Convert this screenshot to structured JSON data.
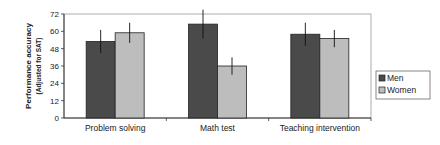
{
  "chart_data": {
    "type": "bar",
    "title": "",
    "xlabel": "",
    "ylabel": "Performance accuracy",
    "ylabel_sub": "(Adjusted for SAT)",
    "categories": [
      "Problem solving",
      "Math test",
      "Teaching intervention"
    ],
    "series": [
      {
        "name": "Men",
        "color": "#4a4a4a",
        "values": [
          53,
          65,
          58
        ],
        "errors": [
          8,
          10,
          8
        ]
      },
      {
        "name": "Women",
        "color": "#bdbdbd",
        "values": [
          59,
          36,
          55
        ],
        "errors": [
          7,
          6,
          6
        ]
      }
    ],
    "ylim": [
      0,
      72
    ],
    "yticks": [
      0,
      12,
      24,
      36,
      48,
      60,
      72
    ],
    "grid": false,
    "legend_position": "right"
  }
}
